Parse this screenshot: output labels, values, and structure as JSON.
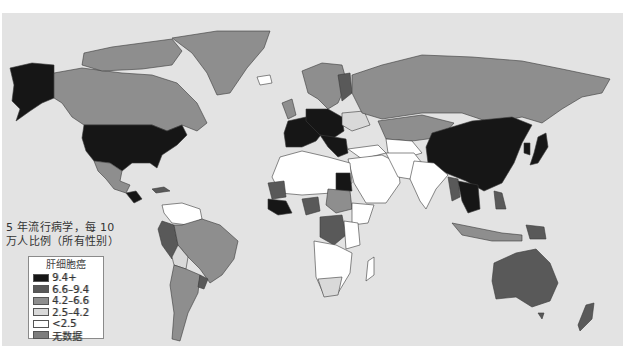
{
  "map": {
    "caption_line1": "5 年流行病学，每 10",
    "caption_line2": "万人比例（所有性别）",
    "background_color": "#e3e3e3"
  },
  "legend": {
    "title": "肝细胞癌",
    "items": [
      {
        "label": "9.4+",
        "color": "#161616"
      },
      {
        "label": "6.6–9.4",
        "color": "#595959"
      },
      {
        "label": "4.2–6.6",
        "color": "#8e8e8e"
      },
      {
        "label": "2.5–4.2",
        "color": "#d9d9d9"
      },
      {
        "label": "<2.5",
        "color": "#ffffff"
      },
      {
        "label": "无数据",
        "color": "#7d7d7d"
      }
    ]
  }
}
